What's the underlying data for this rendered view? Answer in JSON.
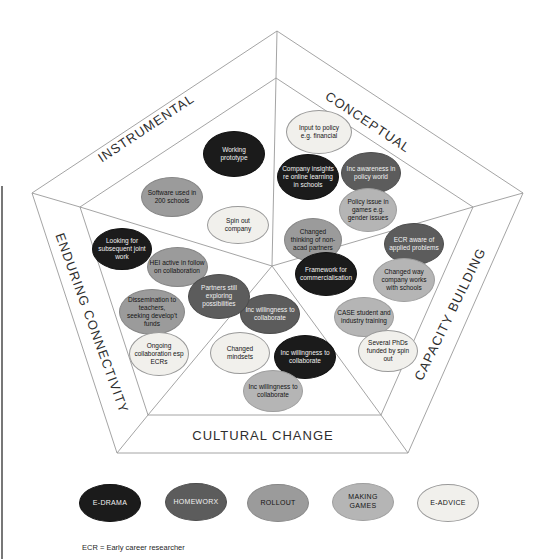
{
  "sectors": {
    "instrumental": "INSTRUMENTAL",
    "conceptual": "CONCEPTUAL",
    "capacity_building": "CAPACITY BUILDING",
    "cultural_change": "CULTURAL CHANGE",
    "enduring_connectivity": "ENDURING CONNECTIVITY"
  },
  "palette": {
    "e_drama": {
      "bg": "#1b1b1b",
      "text": "#f2f2f2",
      "border": "#111111"
    },
    "homeworx": {
      "bg": "#5c5c5c",
      "text": "#f2f2f2",
      "border": "#4d4d4d"
    },
    "rollout": {
      "bg": "#9b9b9b",
      "text": "#141414",
      "border": "#868686"
    },
    "making_games": {
      "bg": "#b5b5b5",
      "text": "#141414",
      "border": "#9e9e9e"
    },
    "e_advice": {
      "bg": "#f1f0ec",
      "text": "#141414",
      "border": "#999999"
    }
  },
  "nodes": [
    {
      "id": "working-prototype",
      "sector": "instrumental",
      "label": "Working\nprototype",
      "color": "e_drama",
      "x": 234,
      "y": 154,
      "w": 62,
      "h": 46
    },
    {
      "id": "software-used-200-schools",
      "sector": "instrumental",
      "label": "Software used in\n200 schools",
      "color": "rollout",
      "x": 172,
      "y": 197,
      "w": 62,
      "h": 40
    },
    {
      "id": "spin-out-company",
      "sector": "instrumental",
      "label": "Spin out\ncompany",
      "color": "e_advice",
      "x": 238,
      "y": 225,
      "w": 62,
      "h": 38
    },
    {
      "id": "input-to-policy",
      "sector": "conceptual",
      "label": "Input to policy\ne.g. financial",
      "color": "e_advice",
      "x": 319,
      "y": 132,
      "w": 66,
      "h": 44
    },
    {
      "id": "company-insights-online-learning",
      "sector": "conceptual",
      "label": "Company insights\nre online learning\nin schools",
      "color": "e_drama",
      "x": 308,
      "y": 177,
      "w": 62,
      "h": 46
    },
    {
      "id": "inc-awareness-policy-world",
      "sector": "conceptual",
      "label": "Inc awareness in\npolicy world",
      "color": "homeworx",
      "x": 371,
      "y": 173,
      "w": 60,
      "h": 42
    },
    {
      "id": "policy-issue-games-gender",
      "sector": "conceptual",
      "label": "Policy issue in\ngames e.g.\ngender issues",
      "color": "making_games",
      "x": 368,
      "y": 210,
      "w": 58,
      "h": 44
    },
    {
      "id": "changed-thinking-non-acad",
      "sector": "conceptual",
      "label": "Changed\nthinking of non-\nacad partners",
      "color": "rollout",
      "x": 313,
      "y": 240,
      "w": 58,
      "h": 44
    },
    {
      "id": "ecr-aware-applied-problems",
      "sector": "capacity_building",
      "label": "ECR aware of\napplied problems",
      "color": "homeworx",
      "x": 414,
      "y": 244,
      "w": 60,
      "h": 42
    },
    {
      "id": "changed-way-company-schools",
      "sector": "capacity_building",
      "label": "Changed way\ncompany works\nwith schools",
      "color": "making_games",
      "x": 404,
      "y": 280,
      "w": 62,
      "h": 44
    },
    {
      "id": "case-student-industry-training",
      "sector": "capacity_building",
      "label": "CASE student and\nindustry training",
      "color": "making_games",
      "x": 364,
      "y": 317,
      "w": 60,
      "h": 40
    },
    {
      "id": "several-phds-spin-out",
      "sector": "capacity_building",
      "label": "Several PhDs\nfunded by spin\nout",
      "color": "e_advice",
      "x": 388,
      "y": 351,
      "w": 60,
      "h": 42
    },
    {
      "id": "framework-commercialisation",
      "sector": "capacity_building",
      "label": "Framework for\ncommercialisation",
      "color": "e_drama",
      "x": 326,
      "y": 274,
      "w": 62,
      "h": 44
    },
    {
      "id": "inc-willingness-collaborate-1",
      "sector": "cultural_change",
      "label": "Inc willingness to\ncollaborate",
      "color": "homeworx",
      "x": 270,
      "y": 314,
      "w": 60,
      "h": 40
    },
    {
      "id": "changed-mindsets",
      "sector": "cultural_change",
      "label": "Changed\nmindsets",
      "color": "e_advice",
      "x": 240,
      "y": 353,
      "w": 60,
      "h": 42
    },
    {
      "id": "inc-willingness-collaborate-2",
      "sector": "cultural_change",
      "label": "Inc willingness to\ncollaborate",
      "color": "e_drama",
      "x": 305,
      "y": 357,
      "w": 62,
      "h": 44
    },
    {
      "id": "inc-willingness-collaborate-3",
      "sector": "cultural_change",
      "label": "Inc willingness to\ncollaborate",
      "color": "making_games",
      "x": 273,
      "y": 391,
      "w": 60,
      "h": 42
    },
    {
      "id": "looking-subsequent-joint-work",
      "sector": "enduring_connectivity",
      "label": "Looking for\nsubsequent joint\nwork",
      "color": "e_drama",
      "x": 122,
      "y": 249,
      "w": 60,
      "h": 42
    },
    {
      "id": "hei-active-follow-on",
      "sector": "enduring_connectivity",
      "label": "HEI active in follow\non collaboration",
      "color": "rollout",
      "x": 177,
      "y": 267,
      "w": 61,
      "h": 40
    },
    {
      "id": "partners-exploring-possibilities",
      "sector": "enduring_connectivity",
      "label": "Partners still\nexploring\npossibilities",
      "color": "homeworx",
      "x": 219,
      "y": 296,
      "w": 62,
      "h": 45
    },
    {
      "id": "dissemination-teachers-funds",
      "sector": "enduring_connectivity",
      "label": "Dissemination to\nteachers,\nseeking develop't\nfunds",
      "color": "rollout",
      "x": 152,
      "y": 312,
      "w": 66,
      "h": 46
    },
    {
      "id": "ongoing-collaboration-ecrs",
      "sector": "enduring_connectivity",
      "label": "Ongoing\ncollaboration esp\nECRs",
      "color": "e_advice",
      "x": 159,
      "y": 354,
      "w": 60,
      "h": 44
    }
  ],
  "legend": {
    "items": [
      {
        "id": "e-drama",
        "label": "E-DRAMA",
        "color": "e_drama",
        "x": 110,
        "y": 503,
        "w": 62,
        "h": 38
      },
      {
        "id": "homeworx",
        "label": "HOMEWORX",
        "color": "homeworx",
        "x": 196,
        "y": 502,
        "w": 62,
        "h": 38
      },
      {
        "id": "rollout",
        "label": "ROLLOUT",
        "color": "rollout",
        "x": 278,
        "y": 503,
        "w": 62,
        "h": 38
      },
      {
        "id": "making-games",
        "label": "MAKING\nGAMES",
        "color": "making_games",
        "x": 363,
        "y": 502,
        "w": 62,
        "h": 38
      },
      {
        "id": "e-advice",
        "label": "E-ADVICE",
        "color": "e_advice",
        "x": 448,
        "y": 503,
        "w": 62,
        "h": 38
      }
    ]
  },
  "footnote": "ECR = Early career researcher"
}
